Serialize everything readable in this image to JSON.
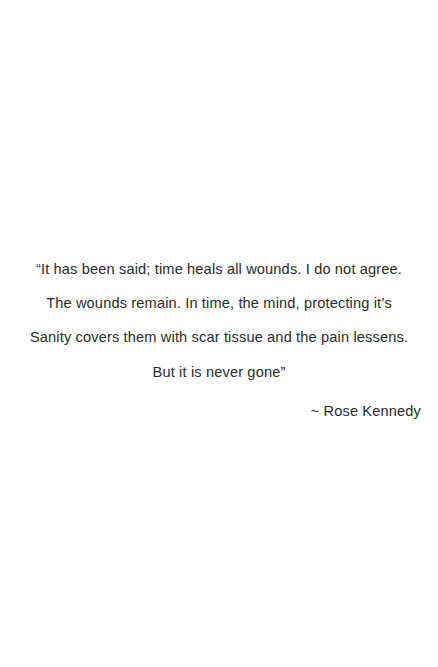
{
  "page": {
    "background_color": "#ffffff",
    "text_color": "#2b2b2b"
  },
  "quote": {
    "lines": [
      "“It has been said; time heals all wounds. I do not agree.",
      "The wounds remain. In time, the mind, protecting it’s",
      "Sanity covers them with scar tissue and the pain lessens.",
      "But it is never gone”"
    ],
    "full_text": "“It has been said; time heals all wounds. I do not agree. The wounds remain. In time, the mind, protecting it’s Sanity covers them with scar tissue and the pain lessens. But it is never gone”",
    "attribution": "~ Rose Kennedy",
    "author_name": "Rose Kennedy"
  }
}
